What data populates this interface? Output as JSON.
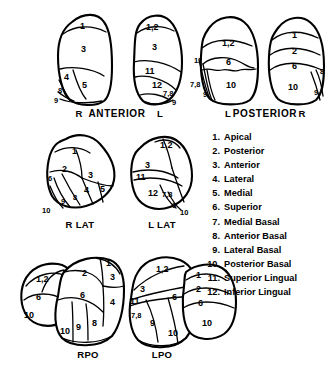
{
  "figure": {
    "rows": [
      {
        "name": "top-row",
        "views": [
          {
            "id": "anterior-right",
            "side_label": "R",
            "segments": [
              "1",
              "3",
              "4",
              "5",
              "8",
              "9"
            ]
          },
          {
            "id": "anterior-left",
            "side_label": "L",
            "segments": [
              "1,2",
              "3",
              "11",
              "12",
              "7,8",
              "9"
            ]
          }
        ],
        "center_label": "ANTERIOR"
      },
      {
        "name": "top-row-posterior",
        "views": [
          {
            "id": "posterior-left",
            "side_label": "L",
            "segments": [
              "1,2",
              "6",
              "10",
              "11",
              "7,8",
              "9"
            ]
          },
          {
            "id": "posterior-right",
            "side_label": "R",
            "segments": [
              "1",
              "2",
              "6",
              "10",
              "8",
              "9"
            ]
          }
        ],
        "center_label": "POSTERIOR"
      },
      {
        "name": "middle-row",
        "views": [
          {
            "id": "right-lateral",
            "view_label": "R LAT",
            "segments": [
              "1",
              "2",
              "3",
              "4",
              "5",
              "6",
              "8",
              "9",
              "10"
            ]
          },
          {
            "id": "left-lateral",
            "view_label": "L LAT",
            "segments": [
              "1,2",
              "3",
              "11",
              "12",
              "7,8",
              "9",
              "10"
            ]
          }
        ]
      },
      {
        "name": "bottom-row",
        "views": [
          {
            "id": "right-posterior-oblique",
            "view_label": "RPO",
            "segments": [
              "1",
              "1,2",
              "2",
              "3",
              "4",
              "6",
              "6",
              "8",
              "9",
              "10",
              "10"
            ]
          },
          {
            "id": "left-posterior-oblique",
            "view_label": "LPO",
            "segments": [
              "1",
              "1,2",
              "2",
              "3",
              "6",
              "6",
              "7,8",
              "9",
              "10",
              "10",
              "11"
            ]
          }
        ]
      }
    ]
  },
  "legend": {
    "items": [
      {
        "number": "1.",
        "label": "Apical"
      },
      {
        "number": "2.",
        "label": "Posterior"
      },
      {
        "number": "3.",
        "label": "Anterior"
      },
      {
        "number": "4.",
        "label": "Lateral"
      },
      {
        "number": "5.",
        "label": "Medial"
      },
      {
        "number": "6.",
        "label": "Superior"
      },
      {
        "number": "7.",
        "label": "Medial Basal"
      },
      {
        "number": "8.",
        "label": "Anterior Basal"
      },
      {
        "number": "9.",
        "label": "Lateral Basal"
      },
      {
        "number": "10.",
        "label": "Posterior Basal"
      },
      {
        "number": "11.",
        "label": "Superior Lingual"
      },
      {
        "number": "12.",
        "label": "Inferior Lingual"
      }
    ]
  },
  "labels": {
    "anterior": "ANTERIOR",
    "posterior": "POSTERIOR",
    "r": "R",
    "l": "L",
    "r_lat": "R LAT",
    "l_lat": "L LAT",
    "rpo": "RPO",
    "lpo": "LPO"
  },
  "colors": {
    "ink": "#000000",
    "paper": "#ffffff"
  }
}
